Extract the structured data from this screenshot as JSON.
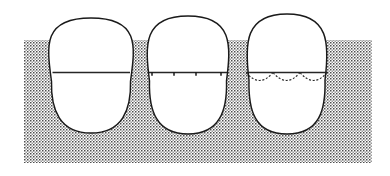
{
  "figure": {
    "background_color": "#ffffff",
    "ink_color": "#1a1a1a",
    "stipple_color": "#555555",
    "canvas": {
      "width": 390,
      "height": 176
    }
  },
  "stipple_region": {
    "name": "dotted background panel",
    "x": 24,
    "y": 40,
    "width": 348,
    "height": 123,
    "dot_spacing": 3,
    "dot_size": 1.5,
    "color": "#4d4d4d"
  },
  "waterline": {
    "label": "horizontal waterline",
    "y": 72.5,
    "color": "#262626"
  },
  "eggs": [
    {
      "index": 1,
      "name": "egg-plain",
      "description": "broad oval egg with plain horizontal line",
      "center_x": 91,
      "top_y": 18,
      "bottom_y": 133,
      "half_width_top": 37,
      "half_width_bottom": 39,
      "line_y": 72.5,
      "line_x1": 52.5,
      "line_x2": 130,
      "marks": [],
      "scallops": []
    },
    {
      "index": 2,
      "name": "egg-ticked",
      "description": "ovoid egg with horizontal line bearing four tick marks",
      "center_x": 188,
      "top_y": 16,
      "bottom_y": 134,
      "half_width_top": 34,
      "half_width_bottom": 40,
      "line_y": 72.5,
      "line_x1": 149,
      "line_x2": 227,
      "marks": [
        152,
        174,
        196,
        221
      ],
      "scallops": []
    },
    {
      "index": 3,
      "name": "egg-scalloped",
      "description": "pointed egg with horizontal line and three dashed scallop arcs below",
      "center_x": 287,
      "top_y": 14,
      "bottom_y": 134,
      "half_width_top": 32,
      "half_width_bottom": 41,
      "line_y": 72.5,
      "line_x1": 246,
      "line_x2": 328,
      "marks": [],
      "scallops": [
        {
          "x1": 246,
          "x2": 273,
          "depth": 11
        },
        {
          "x1": 273,
          "x2": 300,
          "depth": 11
        },
        {
          "x1": 300,
          "x2": 327,
          "depth": 11
        }
      ]
    }
  ]
}
